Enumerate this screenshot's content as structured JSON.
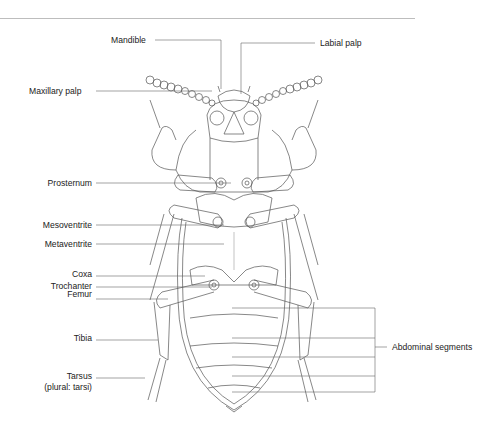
{
  "figure": {
    "labels": {
      "mandible": "Mandible",
      "labial_palp": "Labial palp",
      "maxillary_palp": "Maxillary palp",
      "prosternum": "Prosternum",
      "mesoventrite": "Mesoventrite",
      "metaventrite": "Metaventrite",
      "coxa": "Coxa",
      "trochanter": "Trochanter",
      "femur": "Femur",
      "tibia": "Tibia",
      "tarsus": "Tarsus",
      "tarsus_plural": "(plural: tarsi)",
      "abdominal_segments": "Abdominal segments"
    },
    "colors": {
      "line": "#555555",
      "leader": "#666666",
      "text": "#222222",
      "rule": "#bdbdbd"
    }
  }
}
